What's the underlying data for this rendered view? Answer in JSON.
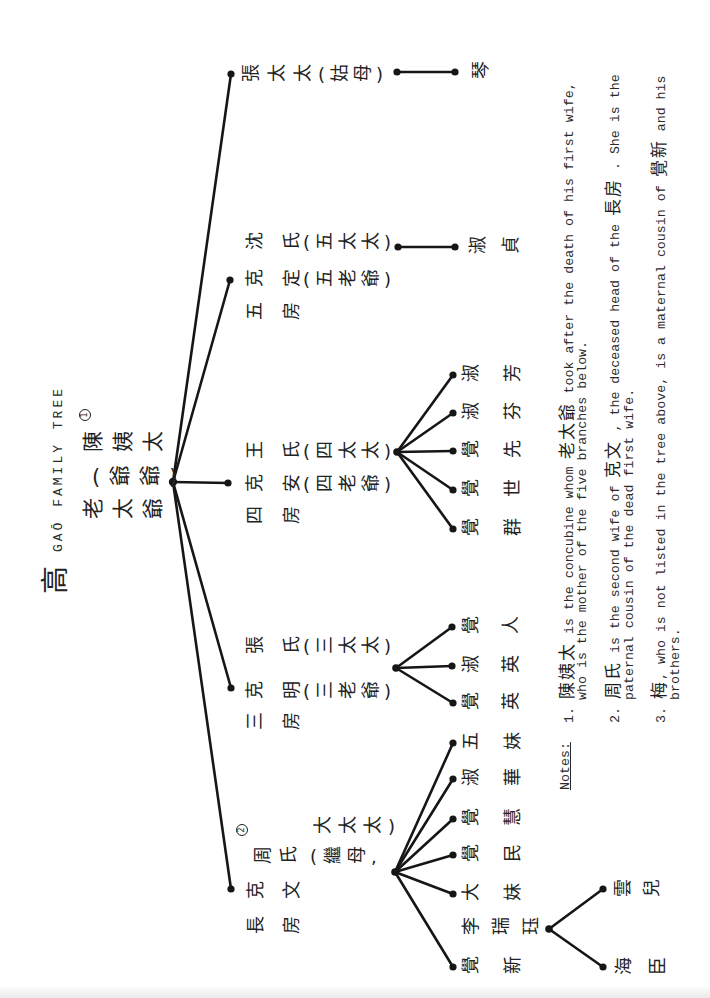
{
  "document": {
    "title_hanzi": "高",
    "title": "GAŌ FAMILY TREE"
  },
  "tree": {
    "root": {
      "name": "老太爺",
      "alias": "(爺爺)",
      "concubine": "陳姨太",
      "concubine_note": "1"
    },
    "branches": [
      {
        "key": "daughter",
        "person": {
          "name": "張太太",
          "title": "(姑母)"
        },
        "children": [
          {
            "name": "琴"
          }
        ]
      },
      {
        "key": "fifth",
        "label": "五房",
        "husband": {
          "name": "克定",
          "title": "(五老爺)"
        },
        "wife": {
          "name": "沈氏",
          "title": "(五太太)"
        },
        "children": [
          {
            "name": "淑貞"
          }
        ]
      },
      {
        "key": "fourth",
        "label": "四房",
        "husband": {
          "name": "克安",
          "title": "(四老爺)"
        },
        "wife": {
          "name": "王氏",
          "title": "(四太太)"
        },
        "children": [
          {
            "name": "淑芳"
          },
          {
            "name": "淑芬"
          },
          {
            "name": "覺先"
          },
          {
            "name": "覺世"
          },
          {
            "name": "覺群"
          }
        ]
      },
      {
        "key": "third",
        "label": "三房",
        "husband": {
          "name": "克明",
          "title": "(三老爺)"
        },
        "wife": {
          "name": "張氏",
          "title": "(三太太)"
        },
        "children": [
          {
            "name": "覺人"
          },
          {
            "name": "淑英"
          },
          {
            "name": "覺英"
          }
        ]
      },
      {
        "key": "eldest",
        "label": "長房",
        "husband": {
          "name": "克文"
        },
        "wife": {
          "name": "周氏",
          "title": "(繼母,",
          "title_cont": "大太太)",
          "note": "2"
        },
        "children": [
          {
            "name": "五妹"
          },
          {
            "name": "淑華"
          },
          {
            "name": "覺慧"
          },
          {
            "name": "覺民"
          },
          {
            "name": "大妹"
          },
          {
            "name": "覺新",
            "spouse": "李瑞珏",
            "children": [
              {
                "name": "雲兒"
              },
              {
                "name": "海臣"
              }
            ]
          }
        ]
      }
    ]
  },
  "notes": {
    "heading": "Notes:",
    "items": [
      {
        "number": "1.",
        "zh_a": "陳姨太",
        "text_a": " is the concubine whom ",
        "zh_b": "老太爺",
        "text_b": " took after the death of his first wife,",
        "continuation": "who is the mother of the five branches below."
      },
      {
        "number": "2.",
        "zh_a": "周氏",
        "text_a": " is the second wife of ",
        "zh_b": "克文",
        "text_b": " , the deceased head of the ",
        "zh_c": "長房",
        "text_c": " . She is the",
        "continuation": "paternal cousin of the dead first wife."
      },
      {
        "number": "3.",
        "zh_a": "梅",
        "text_a": ", who is not listed in the tree above, is a maternal cousin of ",
        "zh_b": "覺新",
        "text_b": " and his",
        "continuation": "brothers."
      }
    ]
  },
  "colors": {
    "ink": "#161616",
    "paper": "#ffffff",
    "typewriter": "#2a2a2a"
  }
}
